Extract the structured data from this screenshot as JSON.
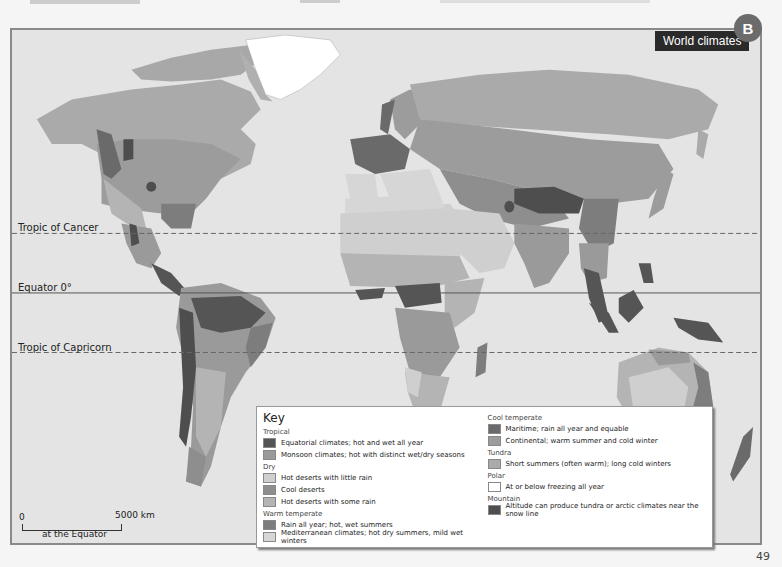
{
  "page": {
    "badge": "B",
    "title": "World climates",
    "page_number": "49"
  },
  "map": {
    "latitude_lines": [
      {
        "label": "Tropic of Cancer",
        "style": "dashed"
      },
      {
        "label": "Equator 0°",
        "style": "solid"
      },
      {
        "label": "Tropic of Capricorn",
        "style": "dashed"
      }
    ],
    "scale": {
      "start": "0",
      "end": "5000 km",
      "note": "at the Equator"
    }
  },
  "key": {
    "title": "Key",
    "groups": [
      {
        "name": "Tropical",
        "items": [
          {
            "label": "Equatorial climates; hot and wet all year",
            "color": "#555555"
          },
          {
            "label": "Monsoon climates; hot with distinct wet/dry seasons",
            "color": "#9a9a9a"
          }
        ]
      },
      {
        "name": "Dry",
        "items": [
          {
            "label": "Hot deserts with little rain",
            "color": "#cfcfcf"
          },
          {
            "label": "Cool deserts",
            "color": "#8e8e8e"
          },
          {
            "label": "Hot deserts with some rain",
            "color": "#b4b4b4"
          }
        ]
      },
      {
        "name": "Warm temperate",
        "items": [
          {
            "label": "Rain all year; hot, wet summers",
            "color": "#7d7d7d"
          },
          {
            "label": "Mediterranean climates; hot dry summers, mild wet winters",
            "color": "#d6d6d6"
          }
        ]
      },
      {
        "name": "Cool temperate",
        "items": [
          {
            "label": "Maritime; rain all year and equable",
            "color": "#6a6a6a"
          },
          {
            "label": "Continental; warm summer and cold winter",
            "color": "#9c9c9c"
          }
        ]
      },
      {
        "name": "Tundra",
        "items": [
          {
            "label": "Short summers (often warm); long cold winters",
            "color": "#aaaaaa"
          }
        ]
      },
      {
        "name": "Polar",
        "items": [
          {
            "label": "At or below freezing all year",
            "color": "#ffffff"
          }
        ]
      },
      {
        "name": "Mountain",
        "items": [
          {
            "label": "Altitude can produce tundra or arctic climates near the snow line",
            "color": "#4e4e4e"
          }
        ]
      }
    ]
  }
}
